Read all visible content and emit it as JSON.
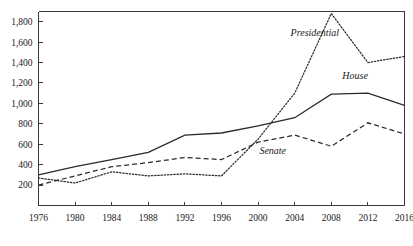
{
  "chart_data": {
    "type": "line",
    "title": "",
    "subtitle": "",
    "xlabel": "",
    "ylabel": "",
    "x": [
      1976,
      1980,
      1984,
      1988,
      1992,
      1996,
      2000,
      2004,
      2008,
      2012,
      2016
    ],
    "xtick_labels": [
      "1976",
      "1980",
      "1984",
      "1988",
      "1992",
      "1996",
      "2000",
      "2004",
      "2008",
      "2012",
      "2016"
    ],
    "ytick_labels": [
      "200",
      "400",
      "600",
      "800",
      "1,000",
      "1,200",
      "1,400",
      "1,600",
      "1,800"
    ],
    "ytick_values": [
      200,
      400,
      600,
      800,
      1000,
      1200,
      1400,
      1600,
      1800
    ],
    "xlim": [
      1976,
      2016
    ],
    "ylim": [
      0,
      1900
    ],
    "grid": false,
    "legend_position": "inline-annotations",
    "series": [
      {
        "name": "Presidential",
        "style": "dotted",
        "color": "#2b2b2b",
        "label_x": 2006.2,
        "label_y": 1660,
        "values": [
          270,
          220,
          330,
          290,
          310,
          290,
          650,
          1100,
          1880,
          1400,
          1460
        ]
      },
      {
        "name": "House",
        "style": "solid",
        "color": "#2b2b2b",
        "label_x": 2010.6,
        "label_y": 1240,
        "values": [
          300,
          380,
          450,
          520,
          690,
          710,
          780,
          860,
          1090,
          1100,
          980
        ]
      },
      {
        "name": "Senate",
        "style": "dashed",
        "color": "#2b2b2b",
        "label_x": 2001.6,
        "label_y": 500,
        "values": [
          200,
          290,
          380,
          420,
          470,
          450,
          620,
          690,
          580,
          810,
          700
        ]
      }
    ]
  }
}
